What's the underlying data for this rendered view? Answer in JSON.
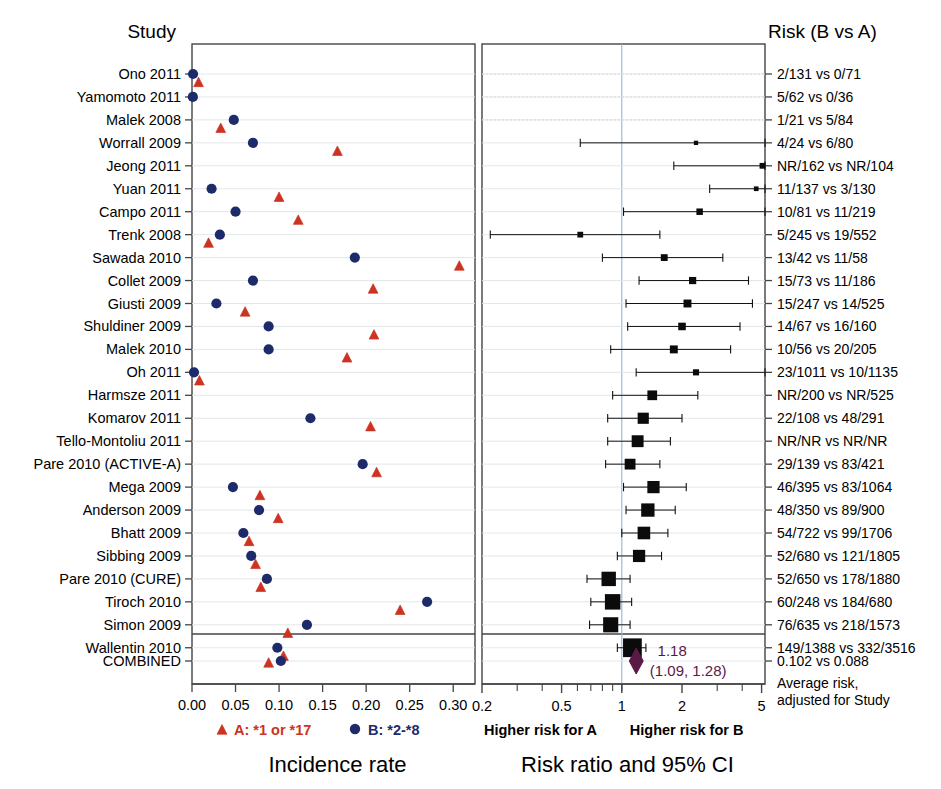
{
  "headers": {
    "study": "Study",
    "risk": "Risk (B vs A)"
  },
  "left_panel": {
    "axis_title": "Incidence rate",
    "ticks": [
      "0.00",
      "0.05",
      "0.10",
      "0.15",
      "0.20",
      "0.25",
      "0.30"
    ],
    "tick_values": [
      0.0,
      0.05,
      0.1,
      0.15,
      0.2,
      0.25,
      0.3
    ],
    "legend": [
      {
        "key": "A",
        "label": "A: *1 or *17",
        "marker": "triangle",
        "color": "#cc3322"
      },
      {
        "key": "B",
        "label": "B: *2-*8",
        "marker": "circle",
        "color": "#1d2b6b"
      }
    ]
  },
  "right_panel": {
    "axis_title": "Risk ratio and 95% CI",
    "ticks_labeled": [
      {
        "label": "0.2",
        "value": 0.2
      },
      {
        "label": "0.5",
        "value": 0.5
      },
      {
        "label": "1",
        "value": 1
      },
      {
        "label": "2",
        "value": 2
      },
      {
        "label": "5",
        "value": 5
      }
    ],
    "ticks_minor": [
      0.3,
      0.4,
      0.6,
      0.7,
      0.8,
      0.9,
      1.0,
      3,
      4
    ],
    "left_note": "Higher risk for A",
    "right_note": "Higher risk for B",
    "reference_line": 1
  },
  "combined": {
    "label": "COMBINED",
    "estimate_text": "1.18",
    "ci_text": "(1.09, 1.28)",
    "estimate": 1.18,
    "ci_low": 1.09,
    "ci_high": 1.28,
    "risk_text": "0.102 vs 0.088",
    "footnote_line1": "Average risk,",
    "footnote_line2": "adjusted for Study",
    "incidence_A": 0.088,
    "incidence_B": 0.102,
    "diamond_color": "#5b1a45"
  },
  "chart_data": {
    "type": "scatter",
    "xlabel": "Incidence rate / Risk ratio and 95% CI",
    "ylabel": "Study",
    "grid": true,
    "legend_position": "bottom",
    "left_xlim": [
      0.0,
      0.325
    ],
    "right_xlim": [
      0.2,
      5.2
    ],
    "right_scale": "log",
    "categories": [
      "Ono 2011",
      "Yamomoto 2011",
      "Malek 2008",
      "Worrall 2009",
      "Jeong 2011",
      "Yuan 2011",
      "Campo 2011",
      "Trenk 2008",
      "Sawada 2010",
      "Collet 2009",
      "Giusti 2009",
      "Shuldiner 2009",
      "Malek 2010",
      "Oh 2011",
      "Harmsze 2011",
      "Komarov 2011",
      "Tello-Montoliu 2011",
      "Pare 2010 (ACTIVE-A)",
      "Mega 2009",
      "Anderson 2009",
      "Bhatt 2009",
      "Sibbing 2009",
      "Pare 2010 (CURE)",
      "Tiroch 2010",
      "Simon 2009",
      "Wallentin 2010"
    ],
    "rows": [
      {
        "study": "Ono 2011",
        "risk": "2/131 vs 0/71",
        "incA": 0.0075,
        "incB": 0.0012,
        "rr": null,
        "lo": null,
        "hi": null,
        "box": 0.0,
        "offscale": true
      },
      {
        "study": "Yamomoto 2011",
        "risk": "5/62 vs 0/36",
        "incA": null,
        "incB": 0.001,
        "rr": null,
        "lo": null,
        "hi": null,
        "box": 0.0,
        "offscale": true
      },
      {
        "study": "Malek 2008",
        "risk": "1/21 vs 5/84",
        "incA": 0.033,
        "incB": 0.048,
        "rr": null,
        "lo": null,
        "hi": null,
        "box": 0.0,
        "offscale": true
      },
      {
        "study": "Worrall 2009",
        "risk": "4/24 vs 6/80",
        "incA": 0.167,
        "incB": 0.07,
        "rr": 2.35,
        "lo": 0.62,
        "hi": 5.2,
        "box": 0.012,
        "dotted": true
      },
      {
        "study": "Jeong 2011",
        "risk": "NR/162 vs NR/104",
        "incA": null,
        "incB": null,
        "rr": 5.05,
        "lo": 1.82,
        "hi": 5.2,
        "box": 0.016
      },
      {
        "study": "Yuan 2011",
        "risk": "11/137 vs 3/130",
        "incA": 0.1,
        "incB": 0.0225,
        "rr": 4.7,
        "lo": 2.75,
        "hi": 5.2,
        "box": 0.013,
        "dotted": true
      },
      {
        "study": "Campo 2011",
        "risk": "10/81 vs 11/219",
        "incA": 0.122,
        "incB": 0.05,
        "rr": 2.45,
        "lo": 1.02,
        "hi": 5.2,
        "box": 0.018
      },
      {
        "study": "Trenk 2008",
        "risk": "5/245 vs 19/552",
        "incA": 0.019,
        "incB": 0.032,
        "rr": 0.62,
        "lo": 0.22,
        "hi": 1.55,
        "box": 0.016
      },
      {
        "study": "Sawada 2010",
        "risk": "13/42 vs 11/58",
        "incA": 0.307,
        "incB": 0.187,
        "rr": 1.63,
        "lo": 0.8,
        "hi": 3.2,
        "box": 0.019
      },
      {
        "study": "Collet 2009",
        "risk": "15/73 vs 11/186",
        "incA": 0.208,
        "incB": 0.07,
        "rr": 2.26,
        "lo": 1.22,
        "hi": 4.3,
        "box": 0.02
      },
      {
        "study": "Giusti 2009",
        "risk": "15/247 vs 14/525",
        "incA": 0.061,
        "incB": 0.028,
        "rr": 2.13,
        "lo": 1.05,
        "hi": 4.5,
        "box": 0.022
      },
      {
        "study": "Shuldiner 2009",
        "risk": "14/67 vs 16/160",
        "incA": 0.209,
        "incB": 0.088,
        "rr": 2.0,
        "lo": 1.07,
        "hi": 3.9,
        "box": 0.021
      },
      {
        "study": "Malek 2010",
        "risk": "10/56 vs 20/205",
        "incA": 0.178,
        "incB": 0.088,
        "rr": 1.82,
        "lo": 0.88,
        "hi": 3.5,
        "box": 0.022
      },
      {
        "study": "Oh 2011",
        "risk": "23/1011 vs 10/1135",
        "incA": 0.0085,
        "incB": 0.0023,
        "rr": 2.35,
        "lo": 1.18,
        "hi": 5.2,
        "box": 0.017
      },
      {
        "study": "Harmsze 2011",
        "risk": "NR/200 vs NR/525",
        "incA": null,
        "incB": null,
        "rr": 1.42,
        "lo": 0.9,
        "hi": 2.4,
        "box": 0.027
      },
      {
        "study": "Komarov 2011",
        "risk": "22/108 vs 48/291",
        "incA": 0.205,
        "incB": 0.136,
        "rr": 1.28,
        "lo": 0.85,
        "hi": 2.0,
        "box": 0.031
      },
      {
        "study": "Tello-Montoliu 2011",
        "risk": "NR/NR vs NR/NR",
        "incA": null,
        "incB": null,
        "rr": 1.2,
        "lo": 0.85,
        "hi": 1.75,
        "box": 0.033
      },
      {
        "study": "Pare 2010 (ACTIVE-A)",
        "risk": "29/139 vs 83/421",
        "incA": 0.212,
        "incB": 0.196,
        "rr": 1.1,
        "lo": 0.83,
        "hi": 1.55,
        "box": 0.03
      },
      {
        "study": "Mega 2009",
        "risk": "46/395 vs 83/1064",
        "incA": 0.078,
        "incB": 0.047,
        "rr": 1.44,
        "lo": 1.02,
        "hi": 2.1,
        "box": 0.034
      },
      {
        "study": "Anderson 2009",
        "risk": "48/350 vs 89/900",
        "incA": 0.099,
        "incB": 0.077,
        "rr": 1.35,
        "lo": 1.05,
        "hi": 1.85,
        "box": 0.037
      },
      {
        "study": "Bhatt 2009",
        "risk": "54/722 vs 99/1706",
        "incA": 0.0655,
        "incB": 0.059,
        "rr": 1.29,
        "lo": 1.0,
        "hi": 1.7,
        "box": 0.035
      },
      {
        "study": "Sibbing 2009",
        "risk": "52/680 vs 121/1805",
        "incA": 0.073,
        "incB": 0.068,
        "rr": 1.22,
        "lo": 0.95,
        "hi": 1.58,
        "box": 0.034
      },
      {
        "study": "Pare 2010 (CURE)",
        "risk": "52/650 vs 178/1880",
        "incA": 0.079,
        "incB": 0.086,
        "rr": 0.86,
        "lo": 0.67,
        "hi": 1.1,
        "box": 0.04
      },
      {
        "study": "Tiroch 2010",
        "risk": "60/248 vs 184/680",
        "incA": 0.239,
        "incB": 0.27,
        "rr": 0.9,
        "lo": 0.7,
        "hi": 1.12,
        "box": 0.043
      },
      {
        "study": "Simon 2009",
        "risk": "76/635 vs 218/1573",
        "incA": 0.11,
        "incB": 0.132,
        "rr": 0.88,
        "lo": 0.69,
        "hi": 1.1,
        "box": 0.042
      },
      {
        "study": "Wallentin 2010",
        "risk": "149/1388 vs 332/3516",
        "incA": 0.105,
        "incB": 0.098,
        "rr": 1.13,
        "lo": 0.95,
        "hi": 1.32,
        "box": 0.052
      }
    ]
  }
}
